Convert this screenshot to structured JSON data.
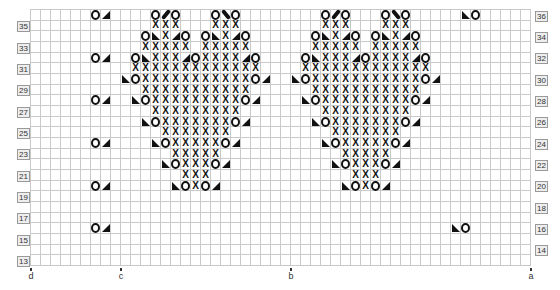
{
  "chart_title": "",
  "grid": {
    "columns": 50,
    "rows_from": 13,
    "rows_to": 36,
    "cell_width": 10,
    "cell_height": 10.67
  },
  "legend_symbols": {
    ".": "empty",
    "X": "x-stitch",
    "O": "yarn-over",
    "L": "left-triangle (bottom-left filled)",
    "R": "right-triangle (bottom-right filled)",
    "/": "cable-right-leaning",
    "\\": "cable-left-leaning"
  },
  "pattern_rows": {
    "36": "......OR....O/O...O\\O......................LO......",
    "35": "............XXX...XXX.............................",
    "34": "...........OLXRO.OLXRO............................",
    "33": "...........XXXXX.XXXXX............................",
    "32": "......OR..OLXXXROXXXXRO...........................",
    "31": "..........XXXXXXXXXXXXX...........................",
    "30": ".........LOXXXXXXXXXXXOR..........................",
    "29": "...........XXXXXXXXXXX............................",
    "28": "......OR..LOXXXXXXXXXOR...........................",
    "27": "............XXXXXXXXX.............................",
    "26": "...........LOXXXXXXXOR............................",
    "25": ".............XXXXXXX..............................",
    "24": "......OR....LOXXXXXOR.............................",
    "23": "..............XXXXX...............................",
    "22": ".............LOXXXOR..............................",
    "21": "...............XXX................................",
    "20": "......OR......LOXOR...............................",
    "19": "..................................................",
    "18": "..................................................",
    "17": "..................................................",
    "16": "......OR..................................LO......",
    "15": "..................................................",
    "14": "..................................................",
    "13": ".................................................."
  },
  "right_motif_offset": 17,
  "left_row_labels": [
    "35",
    "33",
    "31",
    "29",
    "27",
    "25",
    "23",
    "21",
    "19",
    "17",
    "15",
    "13"
  ],
  "right_row_labels": [
    "36",
    "34",
    "32",
    "30",
    "28",
    "26",
    "24",
    "22",
    "20",
    "18",
    "16",
    "14"
  ],
  "bottom_markers": [
    {
      "label": "d",
      "column": 0
    },
    {
      "label": "c",
      "column": 9
    },
    {
      "label": "b",
      "column": 26
    },
    {
      "label": "a",
      "column": 50
    }
  ],
  "colors": {
    "grid_line": "#c9c9c9",
    "symbol": "#111111",
    "label_box_bg": "#eeeeee",
    "label_box_border": "#999999"
  }
}
